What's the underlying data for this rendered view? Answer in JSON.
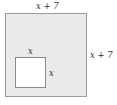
{
  "diagram": {
    "outer_square": {
      "top_label": "x + 7",
      "side_label": "x + 7",
      "fill": "#eaeaea",
      "stroke": "#9a9a9a"
    },
    "inner_square": {
      "top_label": "x",
      "side_label": "x",
      "fill": "#ffffff",
      "stroke": "#8a8a8a"
    }
  }
}
